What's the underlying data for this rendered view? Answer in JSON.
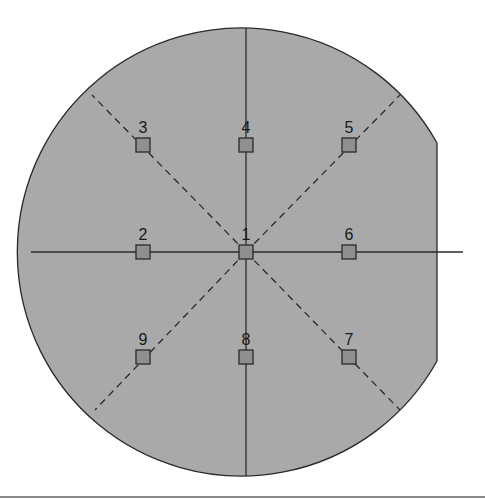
{
  "figure": {
    "type": "wafer-measurement-map",
    "colors": {
      "background": "#ffffff",
      "wafer_fill": "#a9a9a9",
      "outline": "#2a2a2a",
      "marker_fill": "#8f8f8f",
      "bottom_rule": "#888888"
    },
    "points": [
      {
        "label": "1",
        "x": 246,
        "y": 252
      },
      {
        "label": "2",
        "x": 143,
        "y": 252
      },
      {
        "label": "3",
        "x": 143,
        "y": 145
      },
      {
        "label": "4",
        "x": 246,
        "y": 145
      },
      {
        "label": "5",
        "x": 349,
        "y": 145
      },
      {
        "label": "6",
        "x": 349,
        "y": 252
      },
      {
        "label": "7",
        "x": 349,
        "y": 357
      },
      {
        "label": "8",
        "x": 246,
        "y": 357
      },
      {
        "label": "9",
        "x": 143,
        "y": 357
      }
    ]
  }
}
